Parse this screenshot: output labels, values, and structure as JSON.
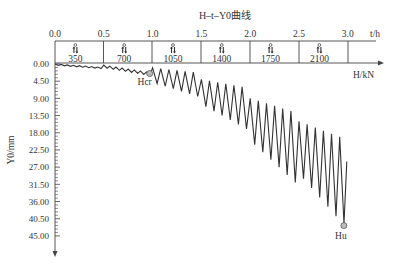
{
  "chart_data": {
    "type": "line",
    "title": "H–t–Y0曲线",
    "top_axis": {
      "label": "t/h",
      "ticks": [
        "0.0",
        "0.5",
        "1.0",
        "1.5",
        "2.0",
        "2.5",
        "3.0"
      ],
      "range": [
        0,
        3.0
      ]
    },
    "load_stages": {
      "label": "H/kN",
      "values": [
        "350",
        "700",
        "1050",
        "1400",
        "1750",
        "2100"
      ],
      "icon": "cyclic-load-arrows-icon"
    },
    "y_axis": {
      "label": "Y0/mm",
      "ticks": [
        "0.00",
        "4.50",
        "9.00",
        "13.50",
        "18.00",
        "22.50",
        "27.00",
        "31.50",
        "36.00",
        "40.50",
        "45.00"
      ],
      "range": [
        0,
        45
      ],
      "inverted": true
    },
    "annotations": [
      {
        "label": "Hcr",
        "t": 0.97,
        "y": 2.5
      },
      {
        "label": "Hu",
        "t": 2.96,
        "y": 42.3
      }
    ],
    "series": [
      {
        "name": "Y0 displacement (cyclic)",
        "stages": [
          {
            "H": 350,
            "t_start": 0.0,
            "t_end": 0.5,
            "peak_min": 0.0,
            "peak_max": 1.2
          },
          {
            "H": 700,
            "t_start": 0.5,
            "t_end": 1.0,
            "peak_min": 0.3,
            "peak_max": 3.0
          },
          {
            "H": 1050,
            "t_start": 1.0,
            "t_end": 1.5,
            "peak_min": 1.0,
            "peak_max": 8.5
          },
          {
            "H": 1400,
            "t_start": 1.5,
            "t_end": 2.0,
            "peak_min": 4.0,
            "peak_max": 17.0
          },
          {
            "H": 1750,
            "t_start": 2.0,
            "t_end": 2.5,
            "peak_min": 9.0,
            "peak_max": 31.0
          },
          {
            "H": 2100,
            "t_start": 2.5,
            "t_end": 3.0,
            "peak_min": 15.0,
            "peak_max": 42.3
          }
        ]
      }
    ],
    "grid": false
  }
}
